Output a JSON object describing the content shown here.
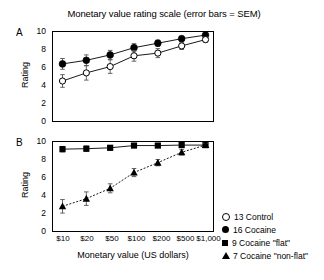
{
  "chart_data": {
    "type": "line",
    "title": "Monetary value rating scale (error bars = SEM)",
    "xlabel": "Monetary value (US dollars)",
    "ylabel": "Rating",
    "categories": [
      "$10",
      "$20",
      "$50",
      "$100",
      "$200",
      "$500",
      "$1,000"
    ],
    "ylim": [
      0,
      10
    ],
    "yticks": [
      "0",
      "2",
      "4",
      "6",
      "8",
      "10"
    ],
    "grid": false,
    "legend_position": "right-bottom",
    "panels": [
      {
        "letter": "A",
        "ylabel": "Rating",
        "series": [
          {
            "name": "16 Cocaine",
            "marker": "filled-circle",
            "values": [
              6.4,
              6.8,
              7.4,
              8.2,
              8.7,
              9.2,
              9.6
            ],
            "errors": [
              0.6,
              0.6,
              0.5,
              0.45,
              0.35,
              0.25,
              0.15
            ]
          },
          {
            "name": "13 Control",
            "marker": "open-circle",
            "values": [
              4.5,
              5.4,
              6.1,
              7.3,
              7.6,
              8.4,
              9.1
            ],
            "errors": [
              0.7,
              0.8,
              0.75,
              0.6,
              0.5,
              0.4,
              0.3
            ]
          }
        ]
      },
      {
        "letter": "B",
        "ylabel": "Rating",
        "series": [
          {
            "name": "9 Cocaine \"flat\"",
            "marker": "filled-square",
            "values": [
              9.15,
              9.2,
              9.3,
              9.55,
              9.55,
              9.6,
              9.6
            ],
            "errors": [
              0.3,
              0.3,
              0.25,
              0.2,
              0.2,
              0.2,
              0.15
            ]
          },
          {
            "name": "7 Cocaine \"non-flat\"",
            "marker": "filled-triangle",
            "values": [
              2.8,
              3.65,
              4.8,
              6.55,
              7.65,
              8.8,
              9.6
            ],
            "errors": [
              0.75,
              0.75,
              0.5,
              0.45,
              0.35,
              0.3,
              0.2
            ]
          }
        ]
      }
    ],
    "legend": [
      {
        "marker": "open-circle",
        "label": "13 Control"
      },
      {
        "marker": "filled-circle",
        "label": "16 Cocaine"
      },
      {
        "marker": "filled-square",
        "label": "9 Cocaine \"flat\""
      },
      {
        "marker": "filled-triangle",
        "label": "7 Cocaine \"non-flat\""
      }
    ]
  }
}
